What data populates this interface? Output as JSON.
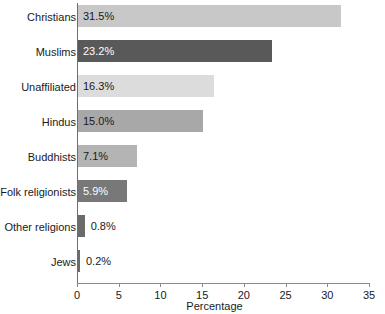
{
  "chart_data": {
    "type": "bar",
    "orientation": "horizontal",
    "title": "",
    "xlabel": "Percentage",
    "ylabel": "",
    "xlim": [
      0,
      35
    ],
    "xticks": [
      0,
      5,
      10,
      15,
      20,
      25,
      30,
      35
    ],
    "xtick_labels": [
      "0",
      "5",
      "10",
      "15",
      "20",
      "25",
      "30",
      "35"
    ],
    "grid": false,
    "legend": false,
    "categories": [
      "Christians",
      "Muslims",
      "Unaffiliated",
      "Hindus",
      "Buddhists",
      "Folk religionists",
      "Other religions",
      "Jews"
    ],
    "values": [
      31.5,
      23.2,
      16.3,
      15.0,
      7.1,
      5.9,
      0.8,
      0.2
    ],
    "value_labels": [
      "31.5%",
      "23.2%",
      "16.3%",
      "15.0%",
      "7.1%",
      "5.9%",
      "0.8%",
      "0.2%"
    ],
    "bar_colors": [
      "#c8c8c8",
      "#595959",
      "#dcdcdc",
      "#a8a8a8",
      "#b4b4b4",
      "#787878",
      "#6b6b6b",
      "#6b6b6b"
    ],
    "label_colors": [
      "#1a1a1a",
      "#ffffff",
      "#1a1a1a",
      "#1a1a1a",
      "#1a1a1a",
      "#ffffff",
      "#1a1a1a",
      "#1a1a1a"
    ],
    "label_inside": [
      true,
      true,
      true,
      true,
      true,
      true,
      false,
      false
    ]
  },
  "axis": {
    "x_title": "Percentage"
  }
}
